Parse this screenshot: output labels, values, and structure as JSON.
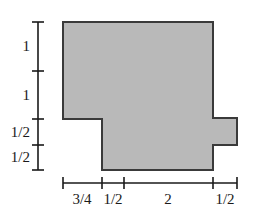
{
  "figure": {
    "fill_color": "#b9b9b9",
    "stroke_color": "#3a3a3a",
    "axis_color": "#1a1a1a",
    "background_color": "#ffffff"
  },
  "shape": {
    "name": "dimensioned-polygon",
    "points": "63,22 213,22 213,118 237,118 237,145 213,145 213,170 102,170 102,119 63,119"
  },
  "vertical_ruler": {
    "x": 38,
    "top": 22,
    "bottom": 170,
    "ticks": [
      22,
      71,
      119,
      145,
      170
    ],
    "segments": [
      {
        "label": "1",
        "center_y": 46
      },
      {
        "label": "1",
        "center_y": 95
      },
      {
        "label": "1/2",
        "center_y": 132
      },
      {
        "label": "1/2",
        "center_y": 157
      }
    ]
  },
  "horizontal_ruler": {
    "y": 183,
    "left": 63,
    "right": 237,
    "ticks": [
      63,
      102,
      124,
      213,
      237
    ],
    "segments": [
      {
        "label": "3/4",
        "center_x": 82
      },
      {
        "label": "1/2",
        "center_x": 113
      },
      {
        "label": "2",
        "center_x": 168
      },
      {
        "label": "1/2",
        "center_x": 225
      }
    ]
  }
}
